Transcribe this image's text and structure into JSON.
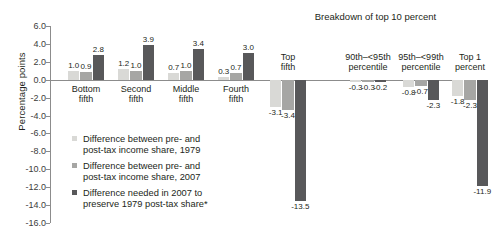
{
  "chart": {
    "type": "bar",
    "title": "",
    "panel_title": "Breakdown of top 10 percent",
    "ylabel": "Percentage points",
    "xlabel": "",
    "ylim": [
      -16.0,
      6.0
    ],
    "ystep": 2.0,
    "grid": false,
    "legend_position": "inside-left",
    "yticks": [
      "6.0",
      "4.0",
      "2.0",
      "0.0",
      "-2.0",
      "-4.0",
      "-6.0",
      "-8.0",
      "-10.0",
      "-12.0",
      "-14.0",
      "-16.0"
    ],
    "categories": [
      "Bottom fifth",
      "Second fifth",
      "Middle fifth",
      "Fourth fifth",
      "Top fifth",
      "90th–<95th percentile",
      "95th–<99th percentile",
      "Top 1 percent"
    ],
    "category_lines": [
      [
        "Bottom",
        "fifth"
      ],
      [
        "Second",
        "fifth"
      ],
      [
        "Middle",
        "fifth"
      ],
      [
        "Fourth",
        "fifth"
      ],
      [
        "Top",
        "fifth"
      ],
      [
        "90th–<95th",
        "percentile"
      ],
      [
        "95th–<99th",
        "percentile"
      ],
      [
        "Top 1",
        "percent"
      ]
    ],
    "series": [
      {
        "name": "Difference between pre- and post-tax income share, 1979",
        "color": "#d9d9d6",
        "values": [
          1.0,
          1.2,
          0.7,
          0.3,
          -3.1,
          -0.3,
          -0.8,
          -1.8
        ]
      },
      {
        "name": "Difference between pre- and post-tax income share, 2007",
        "color": "#a6a6a4",
        "values": [
          0.9,
          1.0,
          1.0,
          0.7,
          -3.4,
          -0.3,
          -0.7,
          -2.3
        ]
      },
      {
        "name": "Difference needed in 2007 to preserve 1979 post-tax share*",
        "color": "#58585a",
        "values": [
          2.8,
          3.9,
          3.4,
          3.0,
          -13.5,
          -0.2,
          -2.3,
          -11.9
        ]
      }
    ],
    "value_labels": [
      [
        "1.0",
        "0.9",
        "2.8"
      ],
      [
        "1.2",
        "1.0",
        "3.9"
      ],
      [
        "0.7",
        "1.0",
        "3.4"
      ],
      [
        "0.3",
        "0.7",
        "3.0"
      ],
      [
        "-3.1",
        "-3.4",
        "-13.5"
      ],
      [
        "-0.3",
        "-0.3",
        "-0.2"
      ],
      [
        "-0.8",
        "-0.7",
        "-2.3"
      ],
      [
        "-1.8",
        "-2.3",
        "-11.9"
      ]
    ]
  },
  "legend": {
    "items": [
      {
        "label_line1": "Difference between pre- and",
        "label_line2": "post-tax income share, 1979",
        "color": "#d9d9d6"
      },
      {
        "label_line1": "Difference between pre- and",
        "label_line2": "post-tax income share, 2007",
        "color": "#a6a6a4"
      },
      {
        "label_line1": "Difference needed in 2007 to",
        "label_line2": "preserve 1979 post-tax share*",
        "color": "#58585a"
      }
    ]
  }
}
